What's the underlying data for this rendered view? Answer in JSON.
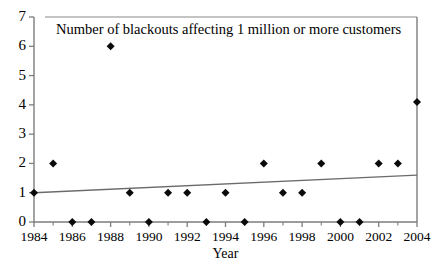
{
  "chart_data": {
    "type": "scatter",
    "title": "Number of blackouts affecting 1 million or more customers",
    "xlabel": "Year",
    "ylabel": "",
    "xlim": [
      1984,
      2004
    ],
    "ylim": [
      0,
      7
    ],
    "grid": false,
    "legend": null,
    "x_tick_labels": [
      "1984",
      "1986",
      "1988",
      "1990",
      "1992",
      "1994",
      "1996",
      "1998",
      "2000",
      "2002",
      "2004"
    ],
    "x_tick_values": [
      1984,
      1986,
      1988,
      1990,
      1992,
      1994,
      1996,
      1998,
      2000,
      2002,
      2004
    ],
    "x_minor_tick_values": [
      1985,
      1987,
      1989,
      1991,
      1993,
      1995,
      1997,
      1999,
      2001,
      2003
    ],
    "y_tick_labels": [
      "0",
      "1",
      "2",
      "3",
      "4",
      "5",
      "6",
      "7"
    ],
    "y_tick_values": [
      0,
      1,
      2,
      3,
      4,
      5,
      6,
      7
    ],
    "x": [
      1984,
      1985,
      1986,
      1987,
      1988,
      1989,
      1990,
      1991,
      1992,
      1993,
      1994,
      1995,
      1996,
      1997,
      1998,
      1999,
      2000,
      2001,
      2002,
      2003,
      2004
    ],
    "values": [
      1,
      2,
      0,
      0,
      6,
      1,
      0,
      1,
      1,
      0,
      1,
      0,
      2,
      1,
      1,
      2,
      0,
      0,
      2,
      2,
      4.1
    ],
    "series": [
      {
        "name": "Blackouts",
        "marker": "diamond",
        "color": "#0a0a0a",
        "points": [
          {
            "x": 1984,
            "y": 1
          },
          {
            "x": 1985,
            "y": 2
          },
          {
            "x": 1986,
            "y": 0
          },
          {
            "x": 1987,
            "y": 0
          },
          {
            "x": 1988,
            "y": 6
          },
          {
            "x": 1989,
            "y": 1
          },
          {
            "x": 1990,
            "y": 0
          },
          {
            "x": 1991,
            "y": 1
          },
          {
            "x": 1992,
            "y": 1
          },
          {
            "x": 1993,
            "y": 0
          },
          {
            "x": 1994,
            "y": 1
          },
          {
            "x": 1995,
            "y": 0
          },
          {
            "x": 1996,
            "y": 2
          },
          {
            "x": 1997,
            "y": 1
          },
          {
            "x": 1998,
            "y": 1
          },
          {
            "x": 1999,
            "y": 2
          },
          {
            "x": 2000,
            "y": 0
          },
          {
            "x": 2001,
            "y": 0
          },
          {
            "x": 2002,
            "y": 2
          },
          {
            "x": 2003,
            "y": 2
          },
          {
            "x": 2004,
            "y": 4.1
          }
        ]
      }
    ],
    "trendline": {
      "name": "Linear trend",
      "color": "#6b6b6b",
      "x_start": 1984,
      "y_start": 1.0,
      "x_end": 2004,
      "y_end": 1.6
    }
  }
}
